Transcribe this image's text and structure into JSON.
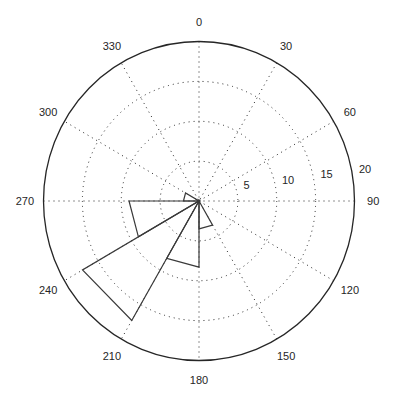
{
  "chart_data": {
    "type": "rose",
    "title": "",
    "center_px": [
      199,
      201
    ],
    "radius_px": [
      155.5,
      159.5
    ],
    "rmax": 20,
    "radial_ticks": [
      5,
      10,
      15,
      20
    ],
    "radial_tick_labels": [
      "5",
      "10",
      "15",
      "20"
    ],
    "radial_label_angle_deg": 82,
    "angle_ticks": [
      0,
      30,
      60,
      90,
      120,
      150,
      180,
      210,
      240,
      270,
      300,
      330
    ],
    "angle_tick_labels": [
      "0",
      "30",
      "60",
      "90",
      "120",
      "150",
      "180",
      "210",
      "240",
      "270",
      "300",
      "330"
    ],
    "angle_direction": "clockwise",
    "zero_location": "top",
    "grid": true,
    "bins": [
      {
        "from_deg": 150,
        "to_deg": 180,
        "value": 3.5
      },
      {
        "from_deg": 180,
        "to_deg": 210,
        "value": 8.3
      },
      {
        "from_deg": 210,
        "to_deg": 240,
        "value": 17.3
      },
      {
        "from_deg": 240,
        "to_deg": 270,
        "value": 9
      },
      {
        "from_deg": 270,
        "to_deg": 300,
        "value": 2
      }
    ],
    "colors": {
      "wedge_stroke": "#3a3a3a",
      "grid": "#262626",
      "text": "#262626",
      "background": "#ffffff"
    }
  }
}
